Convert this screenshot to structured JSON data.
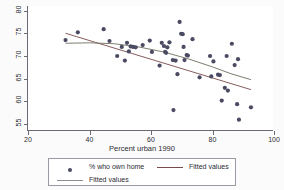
{
  "chart_data": {
    "type": "scatter",
    "title": "",
    "xlabel": "Percent urban 1990",
    "ylabel": "",
    "xlim": [
      20,
      100
    ],
    "ylim": [
      53.5,
      81
    ],
    "xticks": [
      20,
      40,
      60,
      80,
      100
    ],
    "yticks": [
      55,
      60,
      65,
      70,
      75,
      80
    ],
    "grid": false,
    "legend_position": "bottom",
    "series": [
      {
        "name": "% who own home",
        "type": "scatter",
        "marker_color": "#4a4a63",
        "points": [
          [
            32.2,
            73.5
          ],
          [
            36.2,
            75.2
          ],
          [
            44.6,
            75.9
          ],
          [
            46.5,
            73.3
          ],
          [
            49.0,
            70.0
          ],
          [
            50.5,
            72.0
          ],
          [
            51.5,
            69.0
          ],
          [
            52.2,
            72.9
          ],
          [
            52.8,
            71.0
          ],
          [
            53.4,
            72.1
          ],
          [
            54.2,
            72.0
          ],
          [
            55.0,
            71.9
          ],
          [
            57.3,
            72.4
          ],
          [
            59.6,
            73.4
          ],
          [
            60.3,
            70.9
          ],
          [
            62.8,
            67.9
          ],
          [
            63.5,
            72.9
          ],
          [
            64.2,
            72.2
          ],
          [
            64.6,
            70.9
          ],
          [
            64.9,
            70.7
          ],
          [
            65.3,
            71.9
          ],
          [
            66.0,
            73.0
          ],
          [
            67.1,
            69.1
          ],
          [
            67.3,
            58.1
          ],
          [
            68.0,
            69.0
          ],
          [
            68.6,
            66.0
          ],
          [
            69.3,
            77.5
          ],
          [
            69.8,
            74.9
          ],
          [
            70.3,
            74.8
          ],
          [
            70.6,
            72.0
          ],
          [
            70.9,
            69.1
          ],
          [
            71.6,
            70.2
          ],
          [
            72.0,
            70.1
          ],
          [
            73.5,
            73.7
          ],
          [
            75.8,
            65.3
          ],
          [
            79.2,
            70.0
          ],
          [
            79.6,
            65.5
          ],
          [
            80.3,
            68.8
          ],
          [
            81.8,
            65.9
          ],
          [
            82.4,
            65.8
          ],
          [
            83.0,
            60.2
          ],
          [
            84.0,
            63.0
          ],
          [
            84.6,
            70.0
          ],
          [
            85.0,
            62.4
          ],
          [
            86.3,
            72.7
          ],
          [
            87.2,
            68.0
          ],
          [
            88.0,
            59.4
          ],
          [
            88.3,
            69.3
          ],
          [
            88.6,
            56.0
          ],
          [
            92.5,
            58.7
          ]
        ]
      },
      {
        "name": "Fitted values",
        "type": "line",
        "line_color": "#7a4a4a",
        "points": [
          [
            32.2,
            75.0
          ],
          [
            92.5,
            62.6
          ]
        ]
      },
      {
        "name": "Fitted values",
        "type": "line",
        "line_color": "#6f6f60",
        "points": [
          [
            32.2,
            72.8
          ],
          [
            40.0,
            72.9
          ],
          [
            48.0,
            72.7
          ],
          [
            56.0,
            72.0
          ],
          [
            64.0,
            70.9
          ],
          [
            72.0,
            69.4
          ],
          [
            80.0,
            67.6
          ],
          [
            86.0,
            66.1
          ],
          [
            92.5,
            64.8
          ]
        ]
      }
    ],
    "legend": [
      {
        "label": "% who own home",
        "key": "marker"
      },
      {
        "label": "Fitted values",
        "key": "line-dark"
      },
      {
        "label": "Fitted values",
        "key": "line-grey"
      }
    ]
  }
}
